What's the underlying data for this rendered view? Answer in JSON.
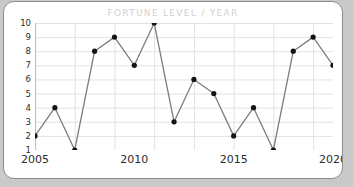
{
  "card": {
    "background_color": "#ffffff",
    "border_color": "#8d8d8d",
    "page_background_color": "#c9c9c9"
  },
  "chart_data": {
    "type": "line",
    "title": "FORTUNE LEVEL / YEAR",
    "xlabel": "",
    "ylabel": "",
    "x": [
      2005,
      2006,
      2007,
      2008,
      2009,
      2010,
      2011,
      2012,
      2013,
      2014,
      2015,
      2016,
      2017,
      2018,
      2019,
      2020
    ],
    "values": [
      2,
      4,
      1,
      8,
      9,
      7,
      10,
      3,
      6,
      5,
      2,
      4,
      1,
      8,
      9,
      7
    ],
    "series": [
      {
        "name": "Fortune Level",
        "values": [
          2,
          4,
          1,
          8,
          9,
          7,
          10,
          3,
          6,
          5,
          2,
          4,
          1,
          8,
          9,
          7
        ]
      }
    ],
    "xlim": [
      2005,
      2020
    ],
    "ylim": [
      1,
      10
    ],
    "x_tick_labels": [
      "2005",
      "2010",
      "2015",
      "2020"
    ],
    "x_tick_values": [
      2005,
      2010,
      2015,
      2020
    ],
    "y_tick_labels": [
      "1",
      "2",
      "3",
      "4",
      "5",
      "6",
      "7",
      "8",
      "9",
      "10"
    ],
    "y_tick_values": [
      1,
      2,
      3,
      4,
      5,
      6,
      7,
      8,
      9,
      10
    ],
    "grid": true,
    "legend": false,
    "line_color": "#7d7d7d",
    "marker_color": "#141414",
    "grid_color": "#e2e2e2",
    "title_color": "#cfcfcf",
    "tick_color": "#2b2b2b"
  }
}
